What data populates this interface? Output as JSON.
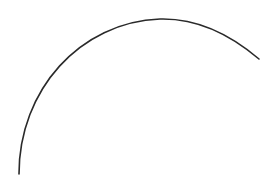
{
  "canvas": {
    "width": 273,
    "height": 181,
    "background": "#ffffff"
  },
  "arc": {
    "stroke": "#2a2a2a",
    "stroke_width": 1.6,
    "path": "M 19 174 C 19 90, 80 22, 160 19 C 200 18, 232 36, 259 59"
  }
}
